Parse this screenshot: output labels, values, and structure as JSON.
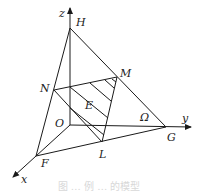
{
  "figure": {
    "type": "3d-coordinate-diagram",
    "axes": [
      {
        "name": "x",
        "label": "x"
      },
      {
        "name": "y",
        "label": "y"
      },
      {
        "name": "z",
        "label": "z"
      }
    ],
    "points": {
      "origin": "O",
      "H": "H",
      "G": "G",
      "F": "F",
      "N": "N",
      "M": "M",
      "L": "L",
      "E": "E",
      "region": "Ω"
    },
    "caption": "图 …  例 …  的模型"
  },
  "colors": {
    "line": "#1a1a1a",
    "label": "#222222",
    "background": "#ffffff"
  }
}
